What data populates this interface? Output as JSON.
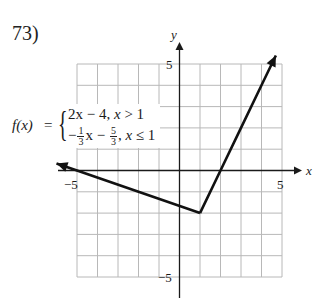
{
  "problem": {
    "number": "73)"
  },
  "formula": {
    "lhs": "f(x)",
    "eq": "=",
    "brace": "{",
    "case1": {
      "expr": "2x − 4, ",
      "cond_var": "x",
      "cond": " > 1"
    },
    "case2": {
      "sign": "−",
      "frac1": {
        "num": "1",
        "den": "3"
      },
      "mid": "x − ",
      "frac2": {
        "num": "5",
        "den": "3"
      },
      "tail": ", ",
      "cond_var": "x",
      "cond": " ≤ 1"
    }
  },
  "axis_labels": {
    "x": "x",
    "y": "y",
    "x_neg": "−5",
    "x_pos": "5",
    "y_pos": "5",
    "y_neg": "−5"
  },
  "colors": {
    "grid": "#b8b8b8",
    "axis": "#1a1a1a",
    "curve": "#111111"
  },
  "chart_data": {
    "type": "line",
    "xlabel": "x",
    "ylabel": "y",
    "xlim": [
      -5,
      5
    ],
    "ylim": [
      -5,
      5
    ],
    "grid": true,
    "grid_step": 1,
    "x_ticks_labeled": [
      -5,
      5
    ],
    "y_ticks_labeled": [
      5,
      -5
    ],
    "series": [
      {
        "name": "−(1/3)x − 5/3, x ≤ 1",
        "points": [
          [
            -6,
            0.33
          ],
          [
            -5,
            0
          ],
          [
            -2,
            -1
          ],
          [
            1,
            -2
          ]
        ],
        "arrow_start": true
      },
      {
        "name": "2x − 4, x > 1",
        "points": [
          [
            1,
            -2
          ],
          [
            2,
            0
          ],
          [
            3,
            2
          ],
          [
            4,
            4
          ],
          [
            4.7,
            5.4
          ]
        ],
        "arrow_end": true
      }
    ],
    "vertex": [
      1,
      -2
    ]
  }
}
